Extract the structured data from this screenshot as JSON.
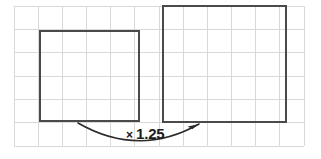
{
  "figure": {
    "type": "geometry-diagram",
    "background_color": "#ffffff",
    "width": 321,
    "height": 159
  },
  "grid": {
    "name": "square-grid",
    "line_color": "#d9d9d9",
    "line_width": 1,
    "left": 14,
    "top": 6,
    "right": 304,
    "bottom": 146,
    "columns": 12,
    "rows": 6,
    "cell_width": 24.2,
    "cell_height": 23.3
  },
  "shapes": [
    {
      "name": "original-square",
      "label": "original square",
      "x": 40,
      "y": 31,
      "width": 99,
      "height": 90,
      "stroke_color": "#4a4a4a",
      "stroke_width": 2,
      "fill": "none",
      "grid_units_wide": 4,
      "grid_units_tall": 4
    },
    {
      "name": "enlarged-square",
      "label": "enlarged square",
      "x": 163,
      "y": 6,
      "width": 123,
      "height": 116,
      "stroke_color": "#4a4a4a",
      "stroke_width": 2,
      "fill": "none",
      "grid_units_wide": 5,
      "grid_units_tall": 5
    }
  ],
  "arrow": {
    "name": "scale-arrow",
    "color": "#2b2b2b",
    "stroke_width": 1.6,
    "start_x": 78,
    "start_y": 123,
    "end_x": 199,
    "end_y": 124,
    "control_x": 139,
    "control_y": 158,
    "direction": "left-to-right",
    "head_style": "solid-triangle"
  },
  "label": {
    "name": "scale-factor-label",
    "multiplication_sign": "×",
    "value": "1.25",
    "full_text": "× 1.25",
    "color": "#1c1c1c",
    "x": 126,
    "y": 126
  },
  "chart_data": {
    "type": "diagram",
    "annotations": [
      "× 1.25"
    ],
    "scale_factor": 1.25,
    "shapes": [
      {
        "name": "original-square",
        "grid_units": [
          4,
          4
        ]
      },
      {
        "name": "enlarged-square",
        "grid_units": [
          5,
          5
        ]
      }
    ]
  }
}
